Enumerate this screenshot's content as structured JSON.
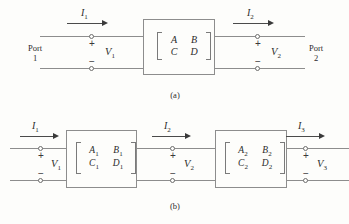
{
  "figure": {
    "background_color": "#fdfdfb",
    "wire_color": "#8d8d8d",
    "text_color": "#2b2b2b"
  },
  "panel_a": {
    "caption": "(a)",
    "port_left": {
      "line1": "Port",
      "line2": "1"
    },
    "port_right": {
      "line1": "Port",
      "line2": "2"
    },
    "current_in": {
      "symbol": "I",
      "sub": "1"
    },
    "current_out": {
      "symbol": "I",
      "sub": "2"
    },
    "voltage_in": {
      "symbol": "V",
      "sub": "1"
    },
    "voltage_out": {
      "symbol": "V",
      "sub": "2"
    },
    "plus_left": "+",
    "minus_left": "−",
    "plus_right": "+",
    "minus_right": "−",
    "matrix": {
      "a": "A",
      "b": "B",
      "c": "C",
      "d": "D",
      "a_sub": "",
      "b_sub": "",
      "c_sub": "",
      "d_sub": ""
    }
  },
  "panel_b": {
    "caption": "(b)",
    "current_1": {
      "symbol": "I",
      "sub": "1"
    },
    "current_2": {
      "symbol": "I",
      "sub": "2"
    },
    "current_3": {
      "symbol": "I",
      "sub": "3"
    },
    "voltage_1": {
      "symbol": "V",
      "sub": "1"
    },
    "voltage_2": {
      "symbol": "V",
      "sub": "2"
    },
    "voltage_3": {
      "symbol": "V",
      "sub": "3"
    },
    "plus_1": "+",
    "minus_1": "−",
    "plus_2": "+",
    "minus_2": "−",
    "plus_3": "+",
    "minus_3": "−",
    "matrix_1": {
      "a": "A",
      "a_sub": "1",
      "b": "B",
      "b_sub": "1",
      "c": "C",
      "c_sub": "1",
      "d": "D",
      "d_sub": "1"
    },
    "matrix_2": {
      "a": "A",
      "a_sub": "2",
      "b": "B",
      "b_sub": "2",
      "c": "C",
      "c_sub": "2",
      "d": "D",
      "d_sub": "2"
    }
  }
}
